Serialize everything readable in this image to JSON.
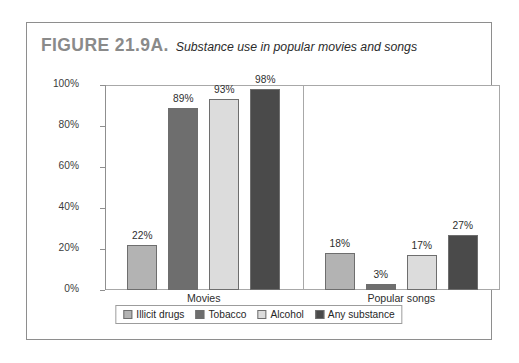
{
  "figure": {
    "number": "FIGURE 21.9A.",
    "title": "Substance use in popular movies and songs"
  },
  "chart_data": {
    "type": "bar",
    "title": "Substance use in popular movies and songs",
    "xlabel": "",
    "ylabel": "",
    "ylim": [
      0,
      100
    ],
    "yticks": [
      "0%",
      "20%",
      "40%",
      "60%",
      "80%",
      "100%"
    ],
    "ytick_values": [
      0,
      20,
      40,
      60,
      80,
      100
    ],
    "grid": false,
    "legend_position": "bottom",
    "categories": [
      "Movies",
      "Popular songs"
    ],
    "series": [
      {
        "name": "Illicit drugs",
        "color": "#b3b3b3",
        "values": [
          22,
          18
        ],
        "labels": [
          "22%",
          "18%"
        ]
      },
      {
        "name": "Tobacco",
        "color": "#6e6e6e",
        "values": [
          89,
          3
        ],
        "labels": [
          "89%",
          "3%"
        ]
      },
      {
        "name": "Alcohol",
        "color": "#dcdcdc",
        "values": [
          93,
          17
        ],
        "labels": [
          "93%",
          "17%"
        ]
      },
      {
        "name": "Any substance",
        "color": "#4a4a4a",
        "values": [
          98,
          27
        ],
        "labels": [
          "98%",
          "27%"
        ]
      }
    ]
  }
}
